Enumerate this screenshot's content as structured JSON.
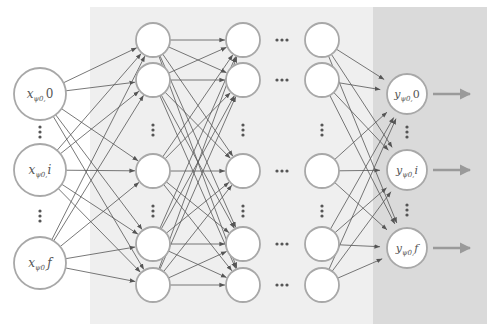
{
  "diagram": {
    "type": "neural-network",
    "colors": {
      "background": "#ffffff",
      "hidden_region": "#efefef",
      "output_region": "#dadada",
      "node_stroke": "#a8a8a8",
      "node_fill": "#ffffff",
      "edge": "#555555",
      "output_arrow": "#9a9a9a",
      "dots": "#555555"
    },
    "input_layer": {
      "nodes": [
        {
          "id": "x0",
          "base": "x",
          "sub": "ψ0",
          "idx": "0",
          "label": "x_{ψ0},0"
        },
        {
          "id": "xi",
          "base": "x",
          "sub": "ψ0",
          "idx": "i",
          "label": "x_{ψ0},i"
        },
        {
          "id": "xf",
          "base": "x",
          "sub": "ψ0",
          "idx": "f",
          "label": "x_{ψ0},f"
        }
      ]
    },
    "hidden_layers": {
      "visible_columns": 3,
      "ellipsis_between_columns": "···",
      "rows_per_column": 6,
      "vertical_ellipsis": "⋮"
    },
    "output_layer": {
      "nodes": [
        {
          "id": "y0",
          "base": "y",
          "sub": "ψ0",
          "idx": "0",
          "label": "y_{ψ0},0"
        },
        {
          "id": "yi",
          "base": "y",
          "sub": "ψ0",
          "idx": "i",
          "label": "y_{ψ0},i"
        },
        {
          "id": "yf",
          "base": "y",
          "sub": "ψ0",
          "idx": "f",
          "label": "y_{ψ0},f"
        }
      ]
    }
  }
}
